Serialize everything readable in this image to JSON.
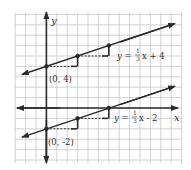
{
  "diagram": {
    "axes": {
      "x_label": "x",
      "y_label": "y"
    },
    "lines": [
      {
        "equation_prefix": "y = ",
        "slope_num": "1",
        "slope_den": "3",
        "equation_suffix": "x + 4",
        "intercept_label": "(0, 4)",
        "slope": 0.3333,
        "intercept": 4
      },
      {
        "equation_prefix": "y = ",
        "slope_num": "1",
        "slope_den": "3",
        "equation_suffix": "x - 2",
        "intercept_label": "(0, -2)",
        "slope": 0.3333,
        "intercept": -2
      }
    ],
    "colors": {
      "grid": "#c8c8c8",
      "line": "#2a2a2a",
      "background": "#ffffff"
    }
  }
}
